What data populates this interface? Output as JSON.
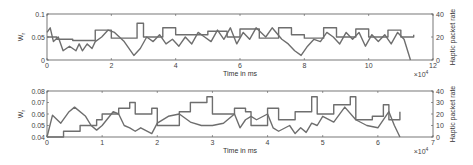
{
  "chart_data": [
    {
      "type": "line",
      "title": "",
      "xlabel": "Time in ms",
      "x_multiplier": "×10^4",
      "ylabel": "W_r",
      "y2label": "Haptic packet rate",
      "xlim": [
        0,
        12
      ],
      "ylim": [
        0,
        0.1
      ],
      "y2lim": [
        0,
        40
      ],
      "x_ticks": [
        "0",
        "2",
        "4",
        "6",
        "8",
        "10",
        "12"
      ],
      "y_ticks": [
        "0",
        "0.05",
        "0.1"
      ],
      "y2_ticks": [
        "0",
        "20",
        "40"
      ],
      "series": [
        {
          "name": "W_r",
          "axis": "left",
          "x": [
            0,
            0.1,
            0.2,
            0.35,
            0.5,
            0.7,
            0.9,
            1.0,
            1.1,
            1.25,
            1.4,
            1.5,
            1.7,
            1.9,
            2.1,
            2.4,
            2.7,
            2.9,
            3.1,
            3.3,
            3.5,
            3.7,
            3.9,
            4.1,
            4.3,
            4.5,
            4.7,
            4.9,
            5.1,
            5.3,
            5.5,
            5.7,
            5.9,
            6.1,
            6.3,
            6.5,
            6.8,
            7.0,
            7.3,
            7.5,
            7.7,
            7.9,
            8.1,
            8.3,
            8.5,
            8.7,
            8.9,
            9.1,
            9.3,
            9.5,
            9.7,
            9.9,
            10.1,
            10.3,
            10.5,
            10.7,
            10.9,
            11.1,
            11.3
          ],
          "y": [
            0.06,
            0.07,
            0.04,
            0.05,
            0.02,
            0.03,
            0.02,
            0.035,
            0.02,
            0.035,
            0.025,
            0.04,
            0.05,
            0.065,
            0.06,
            0.04,
            0.01,
            0.025,
            0.05,
            0.04,
            0.055,
            0.035,
            0.045,
            0.03,
            0.05,
            0.035,
            0.06,
            0.05,
            0.04,
            0.065,
            0.045,
            0.07,
            0.035,
            0.06,
            0.045,
            0.07,
            0.05,
            0.07,
            0.045,
            0.035,
            0.02,
            0.01,
            0.03,
            0.045,
            0.04,
            0.06,
            0.05,
            0.035,
            0.06,
            0.045,
            0.06,
            0.03,
            0.055,
            0.04,
            0.055,
            0.035,
            0.06,
            0.045,
            0.0
          ]
        },
        {
          "name": "Haptic packet rate",
          "axis": "right",
          "shape": "sawtooth-staircase",
          "x": [
            0,
            0.3,
            0.8,
            1.5,
            2.0,
            2.8,
            3.0,
            3.6,
            4.0,
            5.0,
            5.6,
            6.0,
            6.6,
            7.2,
            7.6,
            8.0,
            8.6,
            9.0,
            9.6,
            10.0,
            10.6,
            11.0,
            11.4
          ],
          "y": [
            20,
            18,
            17,
            26,
            19,
            32,
            20,
            28,
            22,
            25,
            20,
            27,
            19,
            28,
            22,
            19,
            28,
            20,
            27,
            20,
            26,
            20,
            22
          ]
        }
      ]
    },
    {
      "type": "line",
      "title": "",
      "xlabel": "Time in ms",
      "x_multiplier": "×10^4",
      "ylabel": "W_r",
      "y2label": "Haptic packet rate",
      "xlim": [
        0,
        7
      ],
      "ylim": [
        0.04,
        0.08
      ],
      "y2lim": [
        0,
        40
      ],
      "x_ticks": [
        "0",
        "1",
        "2",
        "3",
        "4",
        "5",
        "6",
        "7"
      ],
      "y_ticks": [
        "0.04",
        "0.05",
        "0.06",
        "0.07",
        "0.08"
      ],
      "y2_ticks": [
        "0",
        "10",
        "20",
        "30",
        "40"
      ],
      "series": [
        {
          "name": "W_r",
          "axis": "left",
          "x": [
            0,
            0.1,
            0.25,
            0.4,
            0.5,
            0.7,
            0.8,
            0.9,
            1.0,
            1.2,
            1.3,
            1.4,
            1.5,
            1.6,
            1.7,
            1.9,
            2.0,
            2.2,
            2.4,
            2.6,
            2.8,
            3.0,
            3.2,
            3.4,
            3.5,
            3.6,
            3.7,
            3.8,
            4.0,
            4.1,
            4.2,
            4.4,
            4.5,
            4.6,
            4.7,
            4.8,
            4.9,
            5.0,
            5.2,
            5.4,
            5.6,
            5.8,
            6.0,
            6.2,
            6.3,
            6.4
          ],
          "y": [
            0.04,
            0.059,
            0.052,
            0.062,
            0.066,
            0.058,
            0.05,
            0.046,
            0.05,
            0.062,
            0.06,
            0.05,
            0.048,
            0.045,
            0.048,
            0.043,
            0.052,
            0.058,
            0.06,
            0.053,
            0.05,
            0.05,
            0.052,
            0.06,
            0.048,
            0.055,
            0.058,
            0.055,
            0.06,
            0.048,
            0.045,
            0.05,
            0.043,
            0.048,
            0.044,
            0.052,
            0.05,
            0.058,
            0.053,
            0.066,
            0.055,
            0.05,
            0.048,
            0.062,
            0.05,
            0.04
          ]
        },
        {
          "name": "Haptic packet rate",
          "axis": "right",
          "shape": "staircase",
          "x": [
            0,
            0.3,
            0.6,
            0.9,
            1.0,
            1.3,
            1.5,
            1.6,
            1.9,
            2.0,
            2.4,
            2.6,
            2.9,
            3.0,
            3.4,
            3.6,
            3.7,
            4.0,
            4.2,
            4.5,
            4.8,
            4.9,
            5.2,
            5.5,
            5.6,
            5.9,
            6.1,
            6.2,
            6.4
          ],
          "y": [
            0,
            5,
            10,
            15,
            20,
            25,
            30,
            20,
            25,
            10,
            22,
            30,
            35,
            20,
            25,
            22,
            10,
            25,
            15,
            22,
            35,
            20,
            28,
            35,
            15,
            18,
            28,
            15,
            22
          ]
        }
      ]
    }
  ],
  "labels": {
    "top": {
      "xlabel": "Time in ms",
      "ylabel": "W",
      "ylabel_sub": "r",
      "y2label": "Haptic packet rate",
      "multiplier": "×10",
      "multiplier_exp": "4"
    },
    "bottom": {
      "xlabel": "Time in ms",
      "ylabel": "W",
      "ylabel_sub": "r",
      "y2label": "Haptic packet rate",
      "multiplier": "×10",
      "multiplier_exp": "4"
    }
  },
  "colors": {
    "line": "#6e6e6e",
    "axis": "#555555"
  }
}
